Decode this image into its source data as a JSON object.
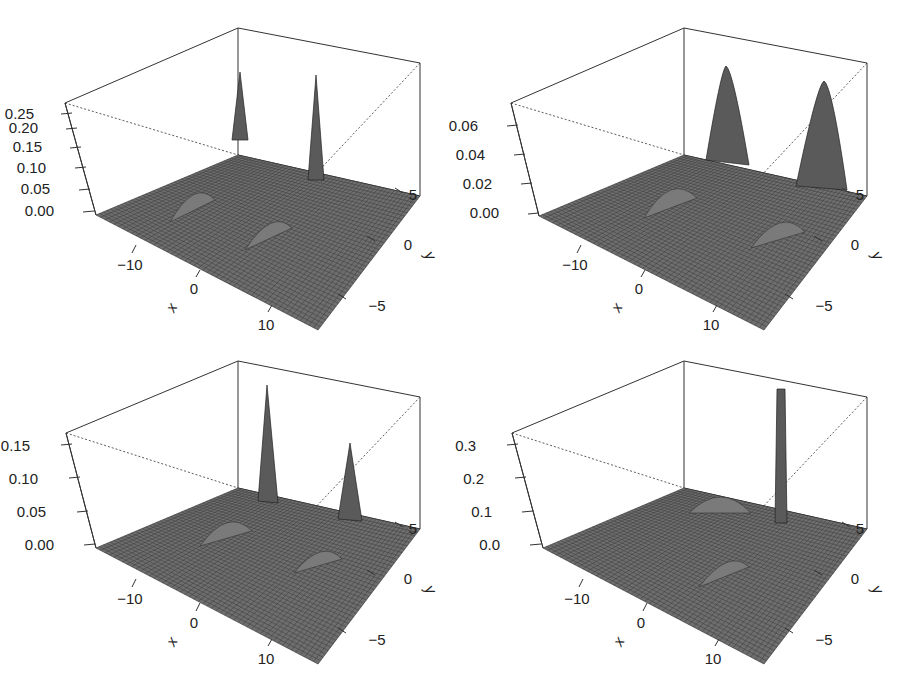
{
  "figure": {
    "layout": "2x2 grid of 3D perspective surface plots",
    "surface_color": "#6e6e6e",
    "mesh_color": "#2a2a2a",
    "box_color": "#333333"
  },
  "chart_data": [
    {
      "type": "surface3d",
      "position": "top-left",
      "xlabel": "x",
      "ylabel": "y",
      "zlabel": "",
      "x_ticks": [
        "-10",
        "0",
        "10"
      ],
      "y_ticks": [
        "-5",
        "0",
        "5"
      ],
      "z_ticks": [
        "0.00",
        "0.05",
        "0.10",
        "0.15",
        "0.20",
        "0.25"
      ],
      "xlim": [
        -15,
        15
      ],
      "ylim": [
        -8,
        8
      ],
      "zlim": [
        0,
        0.27
      ],
      "peaks": [
        {
          "x": -5,
          "y": 5,
          "height": 0.25,
          "width": "narrow"
        },
        {
          "x": 5,
          "y": 5,
          "height": 0.24,
          "width": "narrow"
        },
        {
          "x": -8,
          "y": -3,
          "height": 0.05,
          "width": "wide"
        },
        {
          "x": 3,
          "y": -3,
          "height": 0.05,
          "width": "wide"
        }
      ]
    },
    {
      "type": "surface3d",
      "position": "top-right",
      "xlabel": "x",
      "ylabel": "y",
      "zlabel": "",
      "x_ticks": [
        "-10",
        "0",
        "10"
      ],
      "y_ticks": [
        "-5",
        "0",
        "5"
      ],
      "z_ticks": [
        "0.00",
        "0.02",
        "0.04",
        "0.06"
      ],
      "xlim": [
        -15,
        15
      ],
      "ylim": [
        -8,
        8
      ],
      "zlim": [
        0,
        0.07
      ],
      "peaks": [
        {
          "x": -5,
          "y": 5,
          "height": 0.065,
          "width": "medium"
        },
        {
          "x": 5,
          "y": 5,
          "height": 0.062,
          "width": "medium"
        },
        {
          "x": -8,
          "y": -3,
          "height": 0.013,
          "width": "wide"
        },
        {
          "x": 3,
          "y": -3,
          "height": 0.013,
          "width": "wide"
        }
      ]
    },
    {
      "type": "surface3d",
      "position": "bottom-left",
      "xlabel": "x",
      "ylabel": "y",
      "zlabel": "",
      "x_ticks": [
        "-10",
        "0",
        "10"
      ],
      "y_ticks": [
        "-5",
        "0",
        "5"
      ],
      "z_ticks": [
        "0.00",
        "0.05",
        "0.10",
        "0.15"
      ],
      "xlim": [
        -15,
        15
      ],
      "ylim": [
        -8,
        8
      ],
      "zlim": [
        0,
        0.17
      ],
      "peaks": [
        {
          "x": -5,
          "y": 5,
          "height": 0.16,
          "width": "narrow"
        },
        {
          "x": 5,
          "y": 5,
          "height": 0.11,
          "width": "narrow"
        },
        {
          "x": -8,
          "y": -3,
          "height": 0.03,
          "width": "wide"
        },
        {
          "x": 3,
          "y": -3,
          "height": 0.025,
          "width": "wide"
        }
      ]
    },
    {
      "type": "surface3d",
      "position": "bottom-right",
      "xlabel": "x",
      "ylabel": "y",
      "zlabel": "",
      "x_ticks": [
        "-10",
        "0",
        "10"
      ],
      "y_ticks": [
        "-5",
        "0",
        "5"
      ],
      "z_ticks": [
        "0.0",
        "0.1",
        "0.2",
        "0.3"
      ],
      "xlim": [
        -15,
        15
      ],
      "ylim": [
        -8,
        8
      ],
      "zlim": [
        0,
        0.33
      ],
      "peaks": [
        {
          "x": 5,
          "y": 5,
          "height": 0.33,
          "width": "very narrow"
        },
        {
          "x": -5,
          "y": 5,
          "height": 0.03,
          "width": "wide"
        },
        {
          "x": 3,
          "y": -3,
          "height": 0.04,
          "width": "wide"
        }
      ]
    }
  ]
}
